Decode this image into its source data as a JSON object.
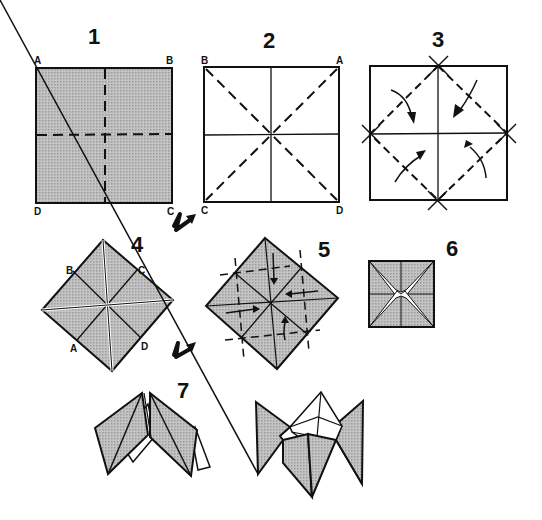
{
  "diagram": {
    "colors": {
      "ink": "#111111",
      "paper_shaded": "#b8b8b8",
      "paper_white": "#ffffff"
    },
    "steps": [
      {
        "number": "1",
        "corners": [
          "A",
          "B",
          "C",
          "D"
        ],
        "description": "Shaded square with valley folds along horizontal and vertical center lines"
      },
      {
        "number": "2",
        "corners": [
          "B",
          "A",
          "C",
          "D"
        ],
        "description": "White square with center creases and dashed diagonals"
      },
      {
        "number": "3",
        "description": "Fold four corners to center, with curved arrows"
      },
      {
        "number": "4",
        "corners": [
          "B",
          "C",
          "A",
          "D"
        ],
        "description": "Shaded diamond after corners folded in"
      },
      {
        "number": "5",
        "description": "Fold corners to center again, arrows pointing inward"
      },
      {
        "number": "6",
        "description": "Small square with star-shaped pockets"
      },
      {
        "number": "7",
        "description": "Open pockets to form the fortune teller"
      }
    ],
    "icons": [
      "turn-over-arrow-icon",
      "turn-over-arrow-icon"
    ]
  }
}
